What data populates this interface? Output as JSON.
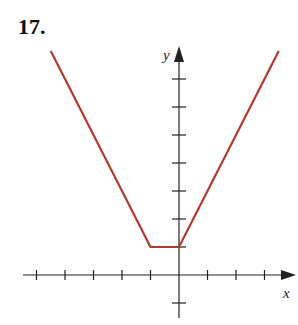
{
  "problem": {
    "number": "17."
  },
  "chart_data": {
    "type": "line",
    "title": "",
    "xlabel": "x",
    "ylabel": "y",
    "xlim": [
      -5,
      4
    ],
    "ylim": [
      -1,
      8
    ],
    "x_ticks": [
      -5,
      -4,
      -3,
      -2,
      -1,
      1,
      2,
      3
    ],
    "y_ticks": [
      -1,
      1,
      2,
      3,
      4,
      5,
      6,
      7
    ],
    "tick_labels_shown": false,
    "grid": false,
    "legend": null,
    "series": [
      {
        "name": "piecewise function",
        "color": "#b03a2e",
        "points": [
          [
            -4.5,
            8
          ],
          [
            -1,
            1
          ],
          [
            0,
            1
          ],
          [
            3.5,
            8
          ]
        ],
        "pieces": [
          {
            "formula": "y = -2x - 1",
            "domain": "x <= -1"
          },
          {
            "formula": "y = 1",
            "domain": "-1 <= x <= 0"
          },
          {
            "formula": "y = 2x + 1",
            "domain": "x >= 0"
          }
        ]
      }
    ]
  },
  "colors": {
    "curve": "#b03a2e",
    "axis": "#222222"
  }
}
